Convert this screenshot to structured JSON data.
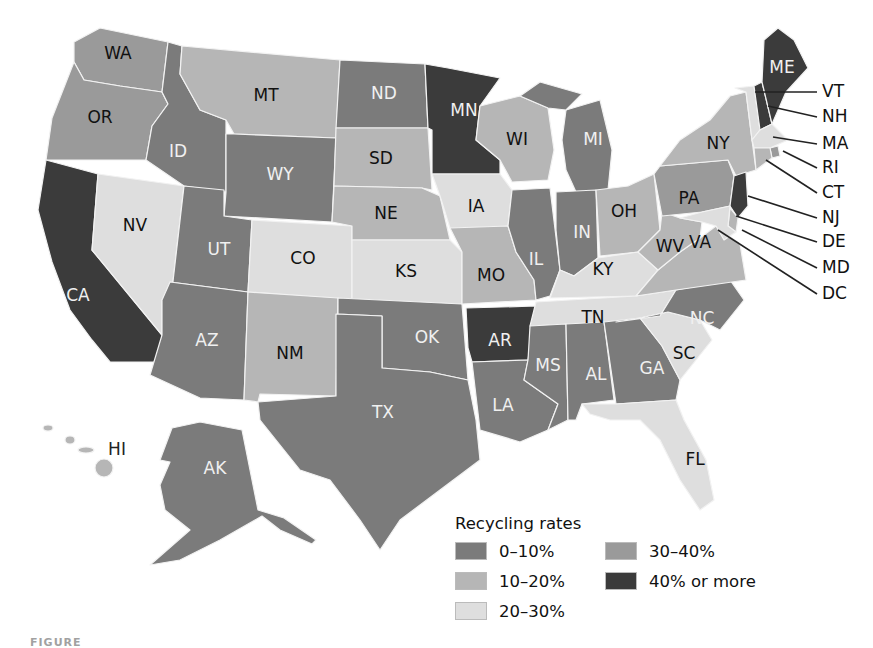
{
  "legend": {
    "title": "Recycling rates",
    "categories": [
      {
        "key": "c0",
        "label": "0–10%",
        "color": "#7b7b7b"
      },
      {
        "key": "c3",
        "label": "30–40%",
        "color": "#9a9a9a"
      },
      {
        "key": "c1",
        "label": "10–20%",
        "color": "#b6b6b6"
      },
      {
        "key": "c4",
        "label": "40% or more",
        "color": "#3b3b3b"
      },
      {
        "key": "c2",
        "label": "20–30%",
        "color": "#dedede"
      }
    ]
  },
  "states": {
    "WA": "30–40%",
    "OR": "30–40%",
    "CA": "40% or more",
    "NV": "20–30%",
    "ID": "0–10%",
    "MT": "10–20%",
    "WY": "0–10%",
    "UT": "0–10%",
    "AZ": "0–10%",
    "CO": "20–30%",
    "NM": "10–20%",
    "ND": "0–10%",
    "SD": "10–20%",
    "NE": "10–20%",
    "KS": "20–30%",
    "OK": "0–10%",
    "TX": "0–10%",
    "MN": "40% or more",
    "IA": "20–30%",
    "MO": "10–20%",
    "AR": "40% or more",
    "LA": "0–10%",
    "WI": "10–20%",
    "IL": "0–10%",
    "MI": "0–10%",
    "IN": "0–10%",
    "OH": "10–20%",
    "KY": "20–30%",
    "TN": "20–30%",
    "MS": "0–10%",
    "AL": "0–10%",
    "GA": "0–10%",
    "FL": "20–30%",
    "SC": "20–30%",
    "NC": "0–10%",
    "VA": "10–20%",
    "WV": "10–20%",
    "PA": "30–40%",
    "NY": "10–20%",
    "ME": "40% or more",
    "VT": "20–30%",
    "NH": "40% or more",
    "MA": "20–30%",
    "RI": "30–40%",
    "CT": "10–20%",
    "NJ": "40% or more",
    "DE": "10–20%",
    "MD": "20–30%",
    "DC": "20–30%",
    "AK": "0–10%",
    "HI": "10–20%"
  },
  "labels": {
    "WA": "WA",
    "OR": "OR",
    "CA": "CA",
    "NV": "NV",
    "ID": "ID",
    "MT": "MT",
    "WY": "WY",
    "UT": "UT",
    "AZ": "AZ",
    "CO": "CO",
    "NM": "NM",
    "ND": "ND",
    "SD": "SD",
    "NE": "NE",
    "KS": "KS",
    "OK": "OK",
    "TX": "TX",
    "MN": "MN",
    "IA": "IA",
    "MO": "MO",
    "AR": "AR",
    "LA": "LA",
    "WI": "WI",
    "IL": "IL",
    "MI": "MI",
    "IN": "IN",
    "OH": "OH",
    "KY": "KY",
    "TN": "TN",
    "MS": "MS",
    "AL": "AL",
    "GA": "GA",
    "FL": "FL",
    "SC": "SC",
    "NC": "NC",
    "VA": "VA",
    "WV": "WV",
    "PA": "PA",
    "NY": "NY",
    "ME": "ME",
    "VT": "VT",
    "NH": "NH",
    "MA": "MA",
    "RI": "RI",
    "CT": "CT",
    "NJ": "NJ",
    "DE": "DE",
    "MD": "MD",
    "DC": "DC",
    "AK": "AK",
    "HI": "HI"
  },
  "caption": "FIGURE"
}
